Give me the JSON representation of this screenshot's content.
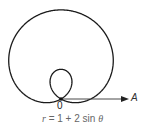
{
  "diagram": {
    "curve": {
      "name": "limaçon",
      "a": 1,
      "b": 2,
      "function": "sin"
    },
    "origin_label": "0",
    "axis_label": "A",
    "equation": {
      "lhs": "r",
      "eq": " = 1 + 2 sin ",
      "var": "θ"
    },
    "colors": {
      "curve": "#1a1a1a",
      "axis": "#333333",
      "equation": "#666666"
    }
  }
}
